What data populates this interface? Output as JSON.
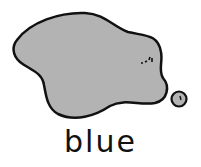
{
  "figure": {
    "label": "blue",
    "shape_fill": "#b3b3b3",
    "outline_color": "#111111"
  }
}
